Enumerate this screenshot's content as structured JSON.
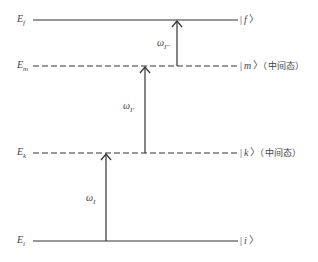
{
  "levels": [
    {
      "id": "f",
      "energy_label": "E",
      "energy_sub": "f",
      "state_label": "f",
      "note": "",
      "y": 20,
      "style": "solid"
    },
    {
      "id": "m",
      "energy_label": "E",
      "energy_sub": "m",
      "state_label": "m",
      "note": "（中间态）",
      "y": 66,
      "style": "dashed"
    },
    {
      "id": "k",
      "energy_label": "E",
      "energy_sub": "k",
      "state_label": "k",
      "note": "（中间态）",
      "y": 153,
      "style": "dashed"
    },
    {
      "id": "i",
      "energy_label": "E",
      "energy_sub": "i",
      "state_label": "i",
      "note": "",
      "y": 241,
      "style": "solid"
    }
  ],
  "transitions": [
    {
      "label": "ω",
      "sub": "I",
      "from": "i",
      "to": "k",
      "x": 106
    },
    {
      "label": "ω",
      "sub": "I'",
      "from": "k",
      "to": "m",
      "x": 145
    },
    {
      "label": "ω",
      "sub": "I''",
      "from": "m",
      "to": "f",
      "x": 177
    }
  ],
  "colors": {
    "line": "#333333",
    "text": "#444444"
  }
}
